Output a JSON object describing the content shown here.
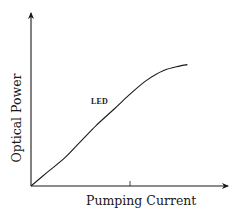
{
  "chart_data": {
    "type": "line",
    "title": "",
    "xlabel": "Pumping Current",
    "ylabel": "Optical Power",
    "grid": false,
    "legend": "none",
    "annotations": [
      {
        "text": "LED",
        "near_x": 0.38,
        "near_y": 0.47
      }
    ],
    "x_ticks": [
      {
        "position": 0.5,
        "label": ""
      }
    ],
    "y_ticks": [],
    "xlim": [
      0,
      1
    ],
    "ylim": [
      0,
      1
    ],
    "series": [
      {
        "name": "LED",
        "x": [
          0.0,
          0.08,
          0.17,
          0.25,
          0.33,
          0.42,
          0.5,
          0.58,
          0.67,
          0.75,
          0.79
        ],
        "y": [
          0.0,
          0.09,
          0.19,
          0.3,
          0.41,
          0.52,
          0.62,
          0.71,
          0.78,
          0.81,
          0.82
        ]
      }
    ],
    "color": "#1a1a1a"
  },
  "labels": {
    "xaxis": "Pumping Current",
    "yaxis": "Optical Power",
    "series": "LED"
  },
  "colors": {
    "ink": "#1a1a1a",
    "background": "#ffffff"
  }
}
